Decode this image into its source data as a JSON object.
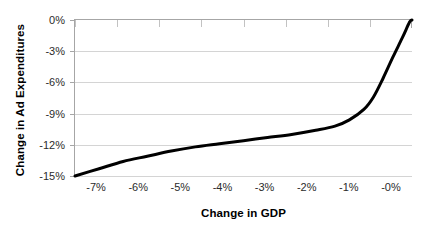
{
  "chart_data": {
    "type": "line",
    "title": "",
    "xlabel": "Change in GDP",
    "ylabel": "Change in Ad Expenditures",
    "categories": [
      "-7%",
      "-6%",
      "-5%",
      "-4%",
      "-3%",
      "-2%",
      "-1%",
      "-0%"
    ],
    "x": [
      -7,
      -6,
      -5,
      -4,
      -3,
      -2,
      -1,
      0
    ],
    "values": [
      -15.0,
      -13.6,
      -12.6,
      -11.9,
      -11.3,
      -10.6,
      -9.2,
      0.0
    ],
    "series": [
      {
        "name": "Change in Ad Expenditures",
        "values": [
          -15.0,
          -13.6,
          -12.6,
          -11.9,
          -11.3,
          -10.6,
          -9.2,
          0.0
        ]
      }
    ],
    "points": [
      {
        "x": -7.0,
        "y": -15.0
      },
      {
        "x": -6.5,
        "y": -14.3
      },
      {
        "x": -6.0,
        "y": -13.6
      },
      {
        "x": -5.5,
        "y": -13.1
      },
      {
        "x": -5.0,
        "y": -12.6
      },
      {
        "x": -4.5,
        "y": -12.2
      },
      {
        "x": -4.0,
        "y": -11.9
      },
      {
        "x": -3.5,
        "y": -11.6
      },
      {
        "x": -3.0,
        "y": -11.3
      },
      {
        "x": -2.5,
        "y": -11.0
      },
      {
        "x": -2.0,
        "y": -10.6
      },
      {
        "x": -1.6,
        "y": -10.2
      },
      {
        "x": -1.3,
        "y": -9.6
      },
      {
        "x": -1.0,
        "y": -8.6
      },
      {
        "x": -0.8,
        "y": -7.4
      },
      {
        "x": -0.6,
        "y": -5.6
      },
      {
        "x": -0.4,
        "y": -3.6
      },
      {
        "x": -0.2,
        "y": -1.7
      },
      {
        "x": -0.05,
        "y": -0.2
      },
      {
        "x": 0.0,
        "y": 0.0
      }
    ],
    "ylim": [
      -15,
      0
    ],
    "yticks": [
      0,
      -3,
      -6,
      -9,
      -12,
      -15
    ],
    "ytick_labels": [
      "0%",
      "-3%",
      "-6%",
      "-9%",
      "-12%",
      "-15%"
    ],
    "xtick_labels": [
      "-7%",
      "-6%",
      "-5%",
      "-4%",
      "-3%",
      "-2%",
      "-1%",
      "-0%"
    ],
    "grid": "horizontal",
    "legend": "none",
    "line_color": "#000000",
    "grid_color": "#d4d4d4",
    "axis_color": "#a6a6a6",
    "background_color": "#ffffff"
  }
}
